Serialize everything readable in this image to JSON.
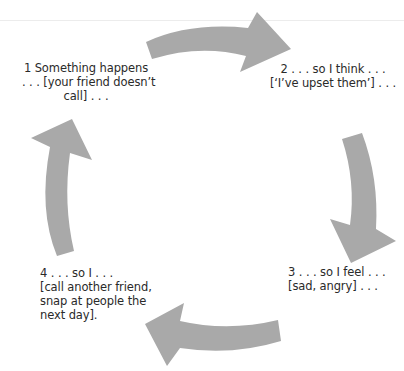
{
  "diagram": {
    "type": "cycle",
    "arrow_color": "#a9a9a9",
    "steps": [
      {
        "number": "1",
        "lines": [
          "1 Something happens",
          ". . . [your friend doesn’t",
          "call] . . ."
        ]
      },
      {
        "number": "2",
        "lines": [
          "2 . . . so I think . . .",
          "[‘I’ve upset them’] . . ."
        ]
      },
      {
        "number": "3",
        "lines": [
          "3 . . . so I feel . . .",
          "[sad, angry] . . ."
        ]
      },
      {
        "number": "4",
        "lines": [
          "4 . . . so I . . .",
          "[call another friend,",
          "snap at people the",
          "next day]."
        ]
      }
    ],
    "arrows": [
      {
        "from": "1",
        "to": "2",
        "direction": "clockwise",
        "icon": "curved-arrow-right-icon"
      },
      {
        "from": "2",
        "to": "3",
        "direction": "clockwise",
        "icon": "curved-arrow-down-icon"
      },
      {
        "from": "3",
        "to": "4",
        "direction": "clockwise",
        "icon": "curved-arrow-left-icon"
      },
      {
        "from": "4",
        "to": "1",
        "direction": "clockwise",
        "icon": "curved-arrow-up-icon"
      }
    ]
  }
}
